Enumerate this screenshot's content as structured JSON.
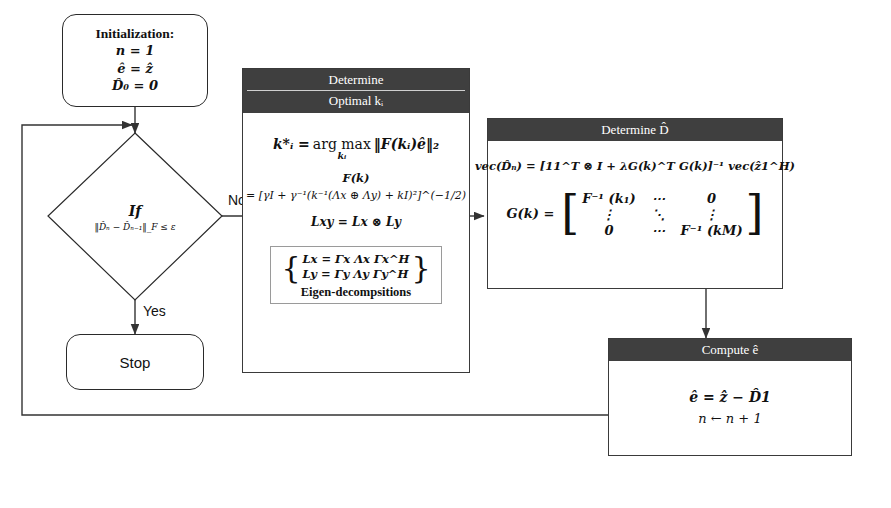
{
  "diagram": {
    "nodes": {
      "initialization": {
        "title": "Initialization:",
        "line1": "n = 1",
        "line2": "ê = ẑ",
        "line3": "D̂₀ = 0"
      },
      "decision": {
        "keyword": "If",
        "condition": "‖D̂ₙ − D̂ₙ₋₁‖_F ≤ ε"
      },
      "stop": {
        "label": "Stop"
      },
      "determine_k": {
        "header_line1": "Determine",
        "header_line2": "Optimal kᵢ",
        "eq_argmax_lhs": "k*ᵢ =",
        "eq_argmax_op": "arg max",
        "eq_argmax_under": "kᵢ",
        "eq_argmax_rhs": "‖F(kᵢ)ê‖₂",
        "fk_label": "F(k)",
        "fk_expr": "= [γI + γ⁻¹(k⁻¹(Λx ⊕ Λy) + kI)²]^(−1/2)",
        "lxy": "Lxy = Lx ⊗ Ly",
        "eig_line1": "Lx = Γx Λx Γx^H",
        "eig_line2": "Ly = Γy Λy Γy^H",
        "eig_caption": "Eigen-decompsitions"
      },
      "determine_D": {
        "header": "Determine D̂",
        "eq_vec": "vec(D̂ₙ) = [11^T ⊗ I + λG(k)^T G(k)]⁻¹ vec(ẑ1^H)",
        "gk_label": "G(k) =",
        "matrix": {
          "r1": [
            "F⁻¹ (k₁)",
            "⋯",
            "0"
          ],
          "r2": [
            "⋮",
            "⋱",
            "⋮"
          ],
          "r3": [
            "0",
            "⋯",
            "F⁻¹ (kM)"
          ]
        }
      },
      "compute_e": {
        "header": "Compute ê",
        "line1": "ê = ẑ − D̂1",
        "line2": "n ← n + 1"
      }
    },
    "edge_labels": {
      "no": "No",
      "yes": "Yes"
    },
    "colors": {
      "header_fill": "#3f3f3f",
      "header_text": "#ffffff",
      "line": "#333333",
      "border": "#2a2a2a"
    }
  }
}
